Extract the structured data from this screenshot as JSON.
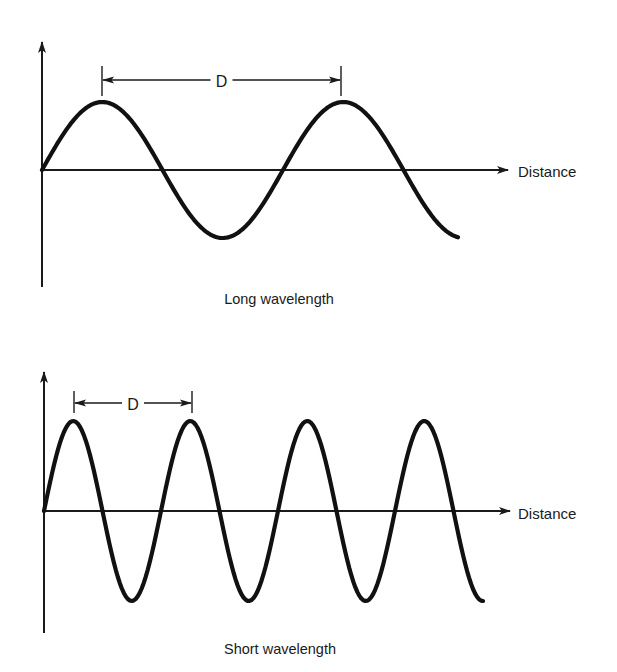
{
  "figure": {
    "panels": [
      {
        "id": "long",
        "caption": "Long wavelength",
        "x_axis_label": "Distance",
        "dimension_label": "D",
        "axis": {
          "origin_x": 42,
          "baseline_y": 170,
          "y_top": 42,
          "y_bottom": 287,
          "x_end": 508
        },
        "wave": {
          "start_x": 42,
          "end_x": 458,
          "period_px": 241,
          "amplitude_px": 68,
          "phase": "sine"
        },
        "dimension": {
          "x1": 102,
          "x2": 341,
          "y": 80,
          "tick_top": 66,
          "tick_bottom": 96
        },
        "caption_pos": {
          "x": 279,
          "y": 299
        },
        "label_pos": {
          "x": 518,
          "y": 171
        }
      },
      {
        "id": "short",
        "caption": "Short wavelength",
        "x_axis_label": "Distance",
        "dimension_label": "D",
        "axis": {
          "origin_x": 44,
          "baseline_y": 511,
          "y_top": 372,
          "y_bottom": 633,
          "x_end": 510
        },
        "wave": {
          "start_x": 44,
          "end_x": 483,
          "period_px": 117,
          "amplitude_px": 90,
          "phase": "sine"
        },
        "dimension": {
          "x1": 74,
          "x2": 192,
          "y": 403,
          "tick_top": 391,
          "tick_bottom": 413
        },
        "caption_pos": {
          "x": 280,
          "y": 649
        },
        "label_pos": {
          "x": 518,
          "y": 513
        }
      }
    ],
    "colors": {
      "ink": "#111111",
      "background": "#ffffff"
    }
  }
}
